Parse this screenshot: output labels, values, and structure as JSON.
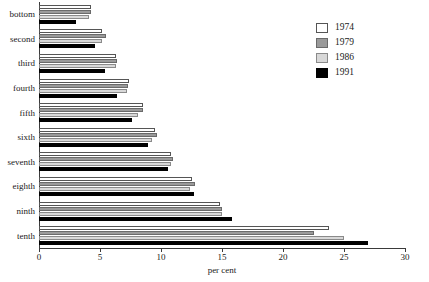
{
  "chart_data": {
    "type": "bar",
    "orientation": "horizontal",
    "title": "",
    "xlabel": "per cent",
    "ylabel": "",
    "xlim": [
      0,
      30
    ],
    "xticks": [
      0,
      5,
      10,
      15,
      20,
      25,
      30
    ],
    "xtick_labels": [
      "0",
      "5",
      "10",
      "15",
      "20",
      "25",
      "30"
    ],
    "grid": false,
    "legend_position": "top-right",
    "categories": [
      "bottom",
      "second",
      "third",
      "fourth",
      "fifth",
      "sixth",
      "seventh",
      "eighth",
      "ninth",
      "tenth"
    ],
    "series": [
      {
        "name": "1974",
        "color": "#ffffff",
        "values": [
          4.3,
          5.2,
          6.3,
          7.4,
          8.5,
          9.5,
          10.8,
          12.5,
          14.8,
          23.8
        ]
      },
      {
        "name": "1979",
        "color": "#9a9a9a",
        "values": [
          4.3,
          5.5,
          6.4,
          7.3,
          8.5,
          9.7,
          11.0,
          12.8,
          15.0,
          22.5
        ]
      },
      {
        "name": "1986",
        "color": "#d8d8d8",
        "values": [
          4.1,
          5.2,
          6.3,
          7.2,
          8.1,
          9.3,
          10.8,
          12.4,
          15.0,
          25.0
        ]
      },
      {
        "name": "1991",
        "color": "#000000",
        "values": [
          3.0,
          4.6,
          5.4,
          6.4,
          7.6,
          8.9,
          10.6,
          12.7,
          15.8,
          27.0
        ]
      }
    ]
  },
  "legend": {
    "items": [
      {
        "label": "1974"
      },
      {
        "label": "1979"
      },
      {
        "label": "1986"
      },
      {
        "label": "1991"
      }
    ]
  }
}
